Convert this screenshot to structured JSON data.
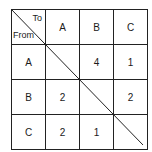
{
  "corner": {
    "to": "To",
    "from": "From"
  },
  "columns": [
    "A",
    "B",
    "C"
  ],
  "rows": [
    {
      "label": "A",
      "values": [
        "",
        "4",
        "1"
      ]
    },
    {
      "label": "B",
      "values": [
        "2",
        "",
        "2"
      ]
    },
    {
      "label": "C",
      "values": [
        "2",
        "1",
        ""
      ]
    }
  ]
}
